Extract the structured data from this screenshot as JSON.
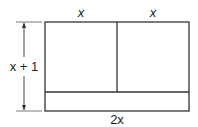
{
  "diagram": {
    "type": "area-model-rectangle",
    "labels": {
      "top_left": "x",
      "top_right": "x",
      "height": "x + 1",
      "bottom": "2x"
    },
    "colors": {
      "stroke": "#333333",
      "text": "#222222",
      "background": "#ffffff"
    }
  }
}
